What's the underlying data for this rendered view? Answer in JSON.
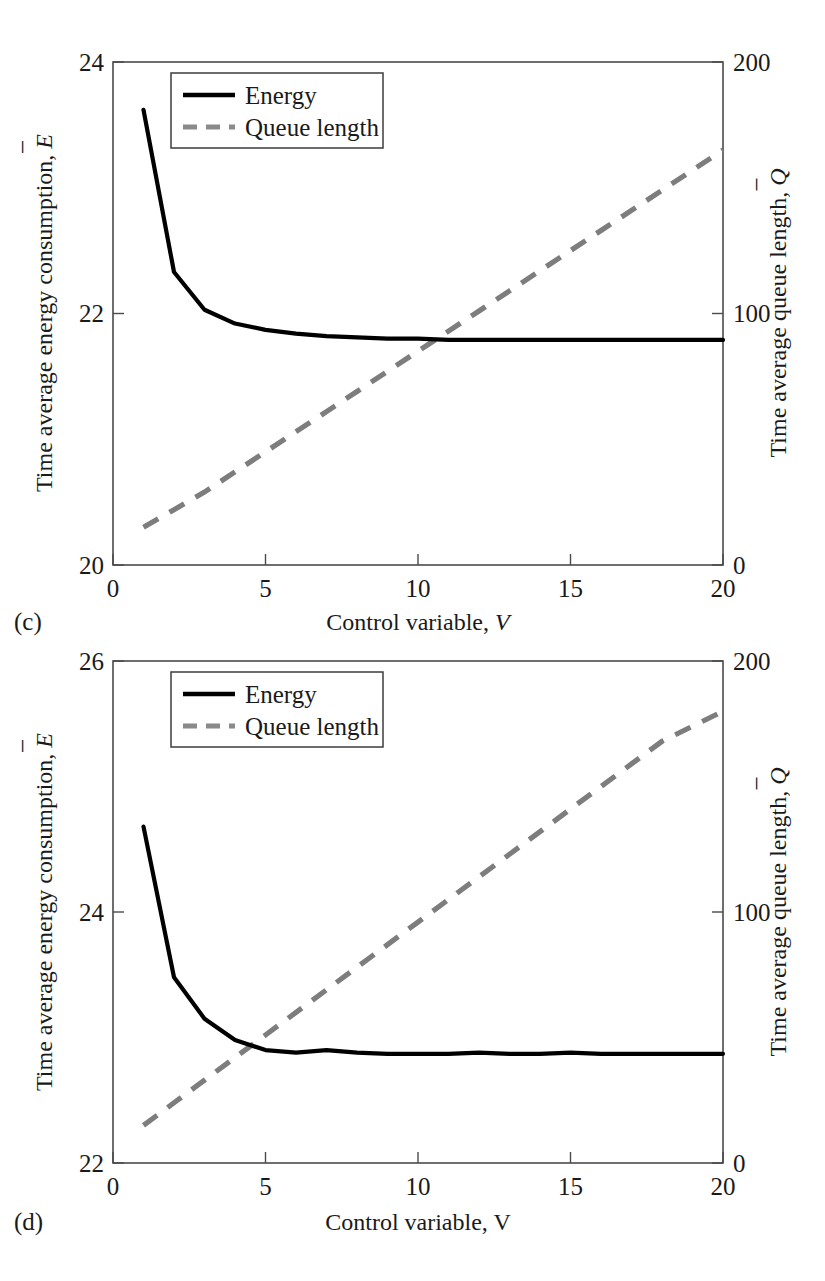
{
  "figure": {
    "panels": [
      {
        "id": "c",
        "letter": "(c)",
        "xlabel_text": "Control variable,",
        "xlabel_symbol": "V",
        "ylabel_left_text": "Time average energy consumption,",
        "ylabel_left_symbol": "E",
        "ylabel_right_text": "Time average queue length,",
        "ylabel_right_symbol": "Q",
        "legend": [
          {
            "label": "Energy",
            "style": "solid",
            "color": "#000000"
          },
          {
            "label": "Queue length",
            "style": "dashed",
            "color": "#7d7d7d"
          }
        ],
        "xticks": [
          "0",
          "5",
          "10",
          "15",
          "20"
        ],
        "yticks_left": [
          "20",
          "22",
          "24"
        ],
        "yticks_right": [
          "0",
          "100",
          "200"
        ]
      },
      {
        "id": "d",
        "letter": "(d)",
        "xlabel_text": "Control variable,",
        "xlabel_symbol": "V",
        "ylabel_left_text": "Time average energy consumption,",
        "ylabel_left_symbol": "E",
        "ylabel_right_text": "Time average queue length,",
        "ylabel_right_symbol": "Q",
        "legend": [
          {
            "label": "Energy",
            "style": "solid",
            "color": "#000000"
          },
          {
            "label": "Queue length",
            "style": "dashed",
            "color": "#7d7d7d"
          }
        ],
        "xticks": [
          "0",
          "5",
          "10",
          "15",
          "20"
        ],
        "yticks_left": [
          "22",
          "24",
          "26"
        ],
        "yticks_right": [
          "0",
          "100",
          "200"
        ]
      }
    ]
  },
  "chart_data": [
    {
      "type": "line",
      "panel": "(c)",
      "title": "",
      "xlabel": "Control variable, V",
      "ylabel": "Time average energy consumption, Ē",
      "ylabel_right": "Time average queue length, Q̄",
      "xlim": [
        0,
        20
      ],
      "ylim": [
        20,
        24
      ],
      "ylim_right": [
        0,
        200
      ],
      "xticks": [
        0,
        5,
        10,
        15,
        20
      ],
      "yticks": [
        20,
        22,
        24
      ],
      "yticks_right": [
        0,
        100,
        200
      ],
      "grid": false,
      "legend_position": "upper-left-inside",
      "x": [
        1,
        2,
        3,
        4,
        5,
        6,
        7,
        8,
        9,
        10,
        11,
        12,
        13,
        14,
        15,
        16,
        17,
        18,
        19,
        20
      ],
      "series": [
        {
          "name": "Energy",
          "axis": "left",
          "style": "solid",
          "color": "#000000",
          "values": [
            23.62,
            22.33,
            22.03,
            21.92,
            21.87,
            21.84,
            21.82,
            21.81,
            21.8,
            21.8,
            21.79,
            21.79,
            21.79,
            21.79,
            21.79,
            21.79,
            21.79,
            21.79,
            21.79,
            21.79
          ]
        },
        {
          "name": "Queue length",
          "axis": "right",
          "style": "dashed",
          "color": "#7d7d7d",
          "values": [
            15,
            22,
            29,
            37,
            45,
            53,
            61,
            69,
            77,
            85,
            93,
            101,
            109,
            117,
            125,
            133,
            141,
            149,
            157,
            165
          ]
        }
      ]
    },
    {
      "type": "line",
      "panel": "(d)",
      "title": "",
      "xlabel": "Control variable, V",
      "ylabel": "Time average energy consumption, Ē",
      "ylabel_right": "Time average queue length, Q̄",
      "xlim": [
        0,
        20
      ],
      "ylim": [
        22,
        26
      ],
      "ylim_right": [
        0,
        200
      ],
      "xticks": [
        0,
        5,
        10,
        15,
        20
      ],
      "yticks": [
        22,
        24,
        26
      ],
      "yticks_right": [
        0,
        100,
        200
      ],
      "grid": false,
      "legend_position": "upper-left-inside",
      "x": [
        1,
        2,
        3,
        4,
        5,
        6,
        7,
        8,
        9,
        10,
        11,
        12,
        13,
        14,
        15,
        16,
        17,
        18,
        19,
        20
      ],
      "series": [
        {
          "name": "Energy",
          "axis": "left",
          "style": "solid",
          "color": "#000000",
          "values": [
            24.68,
            23.48,
            23.15,
            22.98,
            22.9,
            22.88,
            22.9,
            22.88,
            22.87,
            22.87,
            22.87,
            22.88,
            22.87,
            22.87,
            22.88,
            22.87,
            22.87,
            22.87,
            22.87,
            22.87
          ]
        },
        {
          "name": "Queue length",
          "axis": "right",
          "style": "dashed",
          "color": "#7d7d7d",
          "values": [
            15,
            24,
            33,
            42,
            51,
            60,
            69,
            78,
            87,
            96,
            105,
            114,
            123,
            132,
            141,
            150,
            159,
            168,
            174,
            180
          ]
        }
      ]
    }
  ]
}
